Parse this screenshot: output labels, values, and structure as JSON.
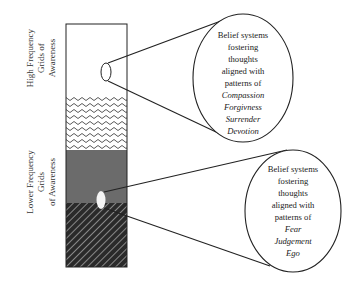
{
  "side_labels": {
    "high": [
      "High Frequency",
      "Grids of",
      "Awareness"
    ],
    "low": [
      "Lower Frequency",
      "Grids",
      "of Awareness"
    ]
  },
  "column": {
    "sections": [
      {
        "name": "white-band",
        "pattern": "plain",
        "color": "#ffffff"
      },
      {
        "name": "wavy-band",
        "pattern": "wavy",
        "color": "#555555"
      },
      {
        "name": "gray-band",
        "pattern": "solid",
        "color": "#6b6b6b"
      },
      {
        "name": "hatched-band",
        "pattern": "diagonal-hatch",
        "color": "#333333"
      }
    ]
  },
  "bubbles": {
    "high": {
      "lines": [
        "Belief systems",
        "fostering",
        "thoughts",
        "aligned with",
        "patterns of"
      ],
      "italic_lines": [
        "Compassion",
        "Forgivness",
        "Surrender",
        "Devotion"
      ]
    },
    "low": {
      "lines": [
        "Belief systems",
        "fostering",
        "thoughts",
        "aligned with",
        "patterns of"
      ],
      "italic_lines": [
        "Fear",
        "Judgement",
        "Ego"
      ]
    }
  },
  "colors": {
    "stroke": "#222222",
    "gray_band": "#6b6b6b",
    "hatch_dark": "#2a2a2a"
  }
}
